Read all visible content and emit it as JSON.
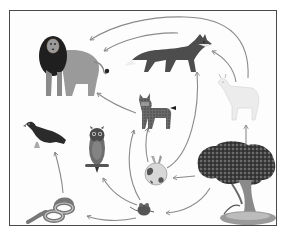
{
  "diagram": {
    "type": "food-web",
    "color_mode": "grayscale",
    "colors": {
      "frame": "#4a4a4a",
      "arrow": "#8a8a8a",
      "background": "#ffffff"
    },
    "organisms": [
      {
        "id": "lion",
        "name": "Lion",
        "role": "apex predator"
      },
      {
        "id": "fox",
        "name": "Fox",
        "role": "predator"
      },
      {
        "id": "goat",
        "name": "Goat",
        "role": "herbivore"
      },
      {
        "id": "lynx",
        "name": "Lynx",
        "role": "predator"
      },
      {
        "id": "eagle",
        "name": "Eagle",
        "role": "predator"
      },
      {
        "id": "owl",
        "name": "Owl",
        "role": "predator"
      },
      {
        "id": "rabbit",
        "name": "Rabbit",
        "role": "herbivore"
      },
      {
        "id": "mouse",
        "name": "Mouse",
        "role": "herbivore"
      },
      {
        "id": "snake",
        "name": "Snake",
        "role": "predator"
      },
      {
        "id": "tree",
        "name": "Tree",
        "role": "producer"
      }
    ],
    "edges": [
      {
        "from": "goat",
        "to": "lion"
      },
      {
        "from": "fox",
        "to": "lion"
      },
      {
        "from": "goat",
        "to": "fox"
      },
      {
        "from": "lynx",
        "to": "lion"
      },
      {
        "from": "rabbit",
        "to": "lynx"
      },
      {
        "from": "mouse",
        "to": "lynx"
      },
      {
        "from": "rabbit",
        "to": "fox"
      },
      {
        "from": "tree",
        "to": "goat"
      },
      {
        "from": "tree",
        "to": "rabbit"
      },
      {
        "from": "tree",
        "to": "mouse"
      },
      {
        "from": "mouse",
        "to": "owl"
      },
      {
        "from": "mouse",
        "to": "snake"
      },
      {
        "from": "snake",
        "to": "eagle"
      }
    ]
  }
}
